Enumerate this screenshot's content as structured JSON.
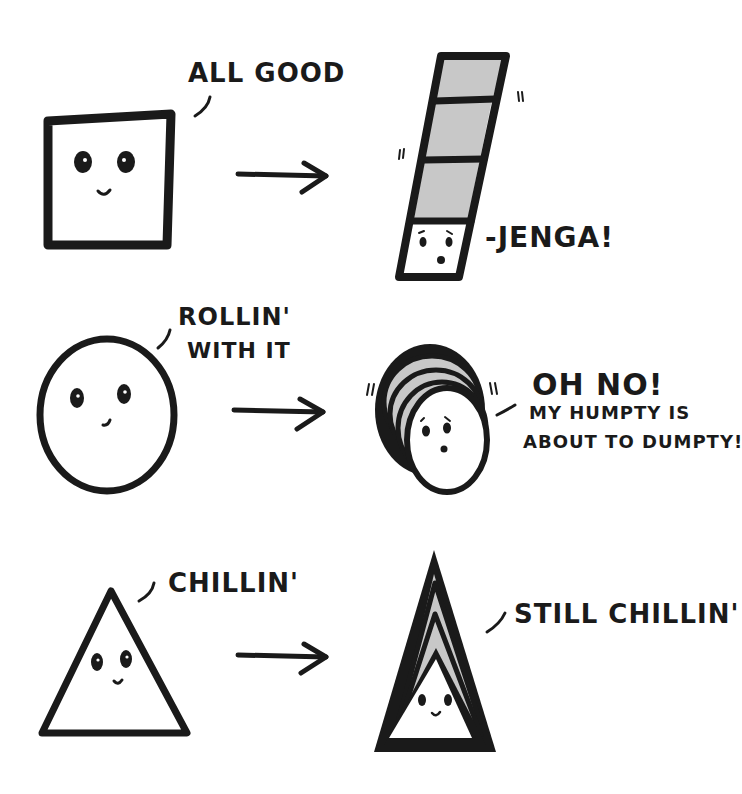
{
  "colors": {
    "ink": "#1a1a1a",
    "block_fill": "#c8c8c8",
    "background": "#ffffff"
  },
  "rows": [
    {
      "shape": "square",
      "before_label": "ALL GOOD",
      "after_label": "JENGA!",
      "after_prefix": "-",
      "arrow": "right-arrow"
    },
    {
      "shape": "circle",
      "before_label_line1": "ROLLIN'",
      "before_label_line2": "WITH IT",
      "after_label_line1": "OH NO!",
      "after_label_line2": "MY HUMPTY IS",
      "after_label_line3": "ABOUT TO DUMPTY!",
      "arrow": "right-arrow"
    },
    {
      "shape": "triangle",
      "before_label": "CHILLIN'",
      "after_label": "STILL CHILLIN'",
      "arrow": "right-arrow"
    }
  ]
}
